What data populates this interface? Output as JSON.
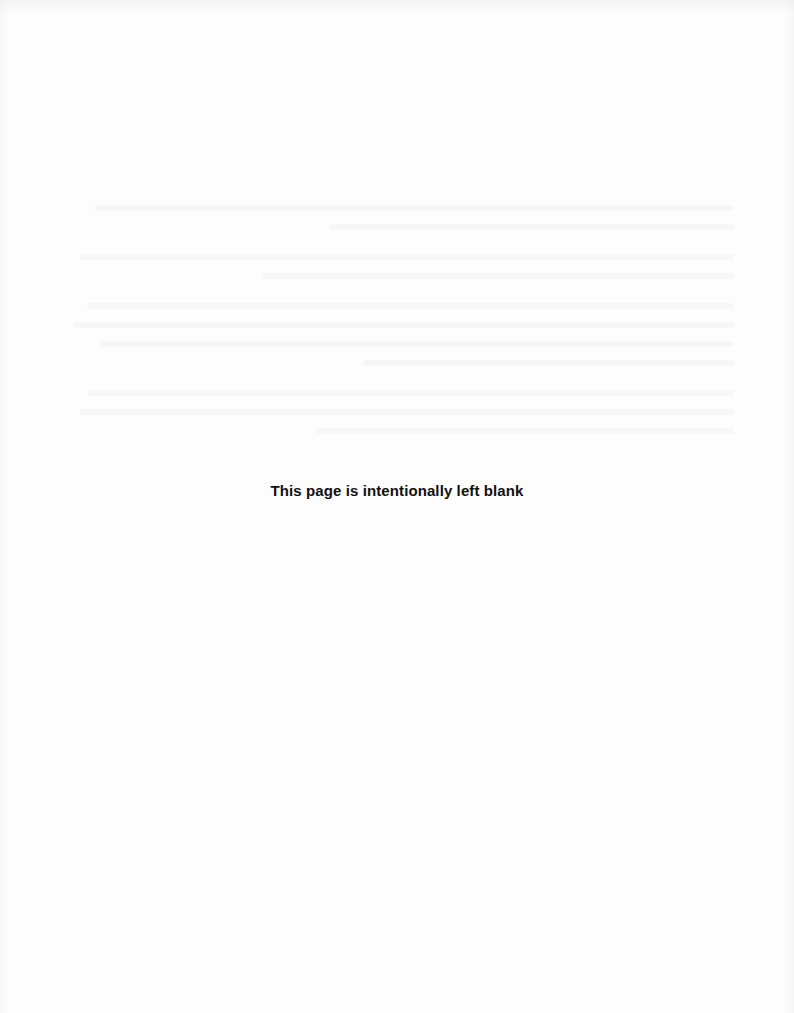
{
  "page": {
    "notice": "This page is intentionally left blank",
    "background_color": "#fdfdfd",
    "text_color": "#111111"
  }
}
